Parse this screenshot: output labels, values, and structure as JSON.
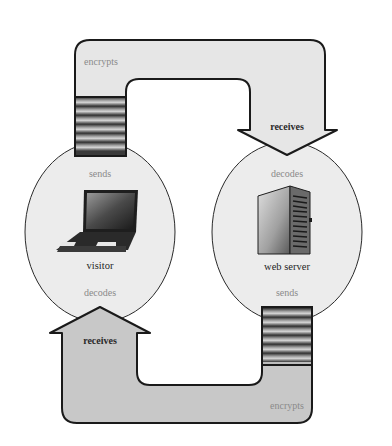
{
  "diagram": {
    "type": "encryption-flow-cycle",
    "colors": {
      "background": "#ffffff",
      "ellipse_fill": "#ececec",
      "top_arrow_fill": "#e6e6e6",
      "bottom_arrow_fill": "#c8c8c8",
      "outline": "#1a1a1a",
      "soft_text": "#8a8a8a",
      "strong_text": "#2a2a2a"
    },
    "nodes": [
      {
        "id": "visitor",
        "label": "visitor",
        "icon": "laptop-icon",
        "top_action": "sends",
        "bottom_action": "decodes"
      },
      {
        "id": "web-server",
        "label": "web server",
        "icon": "server-tower-icon",
        "top_action": "decodes",
        "bottom_action": "sends"
      }
    ],
    "arrows": [
      {
        "id": "top-arrow",
        "from": "visitor",
        "to": "web-server",
        "start_label": "encrypts",
        "end_label": "receives"
      },
      {
        "id": "bottom-arrow",
        "from": "web-server",
        "to": "visitor",
        "start_label": "encrypts",
        "end_label": "receives"
      }
    ]
  }
}
